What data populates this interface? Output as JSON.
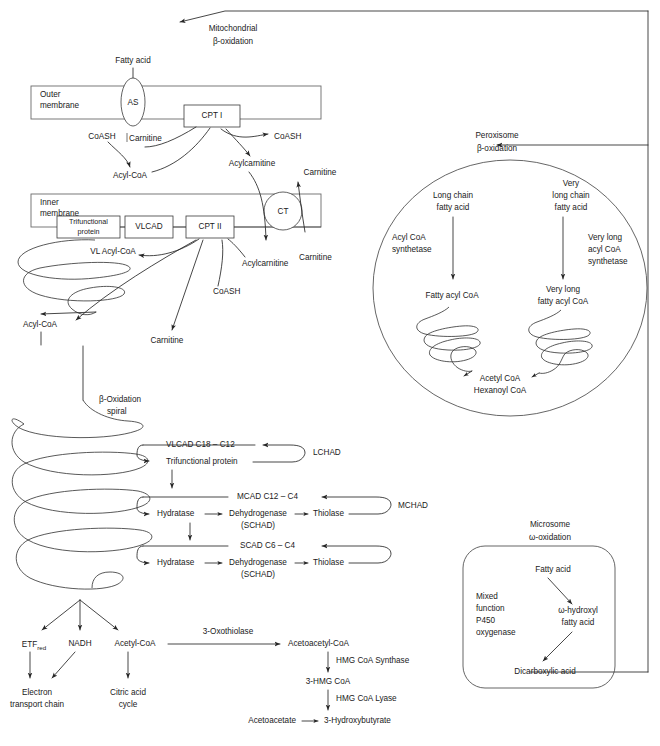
{
  "mitochondrial": {
    "heading_line1": "Mitochondrial",
    "heading_line2": "β-oxidation",
    "fatty_acid": "Fatty acid",
    "outer_membrane_line1": "Outer",
    "outer_membrane_line2": "membrane",
    "inner_membrane_line1": "Inner",
    "inner_membrane_line2": "membrane",
    "as_enzyme": "AS",
    "cpt1": "CPT I",
    "cpt2": "CPT II",
    "ct": "CT",
    "vlcad_box": "VLCAD",
    "trifunctional_box_line1": "Trifunctional",
    "trifunctional_box_line2": "protein",
    "coash_left": "CoASH",
    "carnitine_left": "Carnitine",
    "coash_right": "CoASH",
    "acyl_coa_top": "Acyl-CoA",
    "acylcarnitine_top": "Acylcarnitine",
    "carnitine_top_right": "Carnitine",
    "carnitine_mid_right": "Carnitine",
    "acylcarnitine_mid": "Acylcarnitine",
    "coash_mid": "CoASH",
    "vl_acyl_coa": "VL Acyl-CoA",
    "acyl_coa_mid": "Acyl-CoA",
    "carnitine_mid": "Carnitine",
    "spiral_label_line1": "β-Oxidation",
    "spiral_label_line2": "spiral"
  },
  "cycles": [
    {
      "name": "vlcad-cycle",
      "top_label": "VLCAD C18 – C12",
      "steps": [
        "Trifunctional protein"
      ],
      "side_label": "LCHAD",
      "sub_label": ""
    },
    {
      "name": "mcad-cycle",
      "top_label": "MCAD C12 – C4",
      "steps": [
        "Hydratase",
        "Dehydrogenase",
        "Thiolase"
      ],
      "sub_label": "(SCHAD)",
      "side_label": "MCHAD"
    },
    {
      "name": "scad-cycle",
      "top_label": "SCAD C6 – C4",
      "steps": [
        "Hydratase",
        "Dehydrogenase",
        "Thiolase"
      ],
      "sub_label": "(SCHAD)",
      "side_label": ""
    }
  ],
  "products": {
    "etf": "ETF",
    "etf_sub": "red",
    "nadh": "NADH",
    "acetyl_coa": "Acetyl-CoA",
    "electron_chain_line1": "Electron",
    "electron_chain_line2": "transport chain",
    "citric_acid_line1": "Citric acid",
    "citric_acid_line2": "cycle"
  },
  "ketogenesis": {
    "oxothiolase": "3-Oxothiolase",
    "acetoacetyl_coa": "Acetoacetyl-CoA",
    "hmg_synthase": "HMG CoA Synthase",
    "hmg_coa": "3-HMG CoA",
    "hmg_lyase": "HMG CoA Lyase",
    "acetoacetate": "Acetoacetate",
    "hydroxybutyrate": "3-Hydroxybutyrate"
  },
  "peroxisome": {
    "heading_line1": "Peroxisome",
    "heading_line2": "β-oxidation",
    "long_chain_line1": "Long chain",
    "long_chain_line2": "fatty acid",
    "very_long_chain_line1": "Very",
    "very_long_chain_line2": "long chain",
    "very_long_chain_line3": "fatty acid",
    "acyl_coa_synthetase_line1": "Acyl CoA",
    "acyl_coa_synthetase_line2": "synthetase",
    "vl_acyl_coa_synthetase_line1": "Very long",
    "vl_acyl_coa_synthetase_line2": "acyl CoA",
    "vl_acyl_coa_synthetase_line3": "synthetase",
    "fatty_acyl_coa": "Fatty acyl CoA",
    "vl_fatty_acyl_coa_line1": "Very long",
    "vl_fatty_acyl_coa_line2": "fatty acyl CoA",
    "acetyl_coa": "Acetyl CoA",
    "hexanoyl_coa": "Hexanoyl CoA"
  },
  "microsome": {
    "heading_line1": "Microsome",
    "heading_line2": "ω-oxidation",
    "fatty_acid": "Fatty acid",
    "mixed_function_line1": "Mixed",
    "mixed_function_line2": "function",
    "mixed_function_line3": "P450",
    "mixed_function_line4": "oxygenase",
    "omega_hydroxyl_line1": "ω-hydroxyl",
    "omega_hydroxyl_line2": "fatty acid",
    "dicarboxylic_acid": "Dicarboxylic acid"
  },
  "colors": {
    "stroke": "#262626",
    "membrane": "#6a6a6a",
    "text": "#1a1a1a",
    "background": "#ffffff"
  }
}
